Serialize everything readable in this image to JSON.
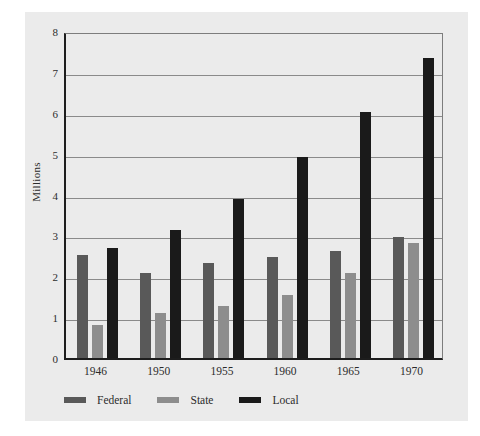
{
  "chart_data": {
    "type": "bar",
    "title": "",
    "xlabel": "",
    "ylabel": "Millions",
    "categories": [
      "1946",
      "1950",
      "1955",
      "1960",
      "1965",
      "1970"
    ],
    "series": [
      {
        "name": "Federal",
        "color": "#595959",
        "values": [
          2.52,
          2.08,
          2.33,
          2.47,
          2.62,
          2.95
        ]
      },
      {
        "name": "State",
        "color": "#8d8d8d",
        "values": [
          0.8,
          1.11,
          1.27,
          1.53,
          2.09,
          2.82
        ]
      },
      {
        "name": "Local",
        "color": "#1a1a1a",
        "values": [
          2.69,
          3.14,
          3.89,
          4.93,
          6.01,
          7.34
        ]
      }
    ],
    "ylim": [
      0,
      8
    ],
    "yticks": [
      "0",
      "1",
      "2",
      "3",
      "4",
      "5",
      "6",
      "7",
      "8"
    ],
    "grid": true,
    "legend_position": "bottom-left",
    "panel_background": "#ebebeb",
    "axis_color": "#1d1d1d",
    "gridline_color": "#8a8a8a"
  }
}
